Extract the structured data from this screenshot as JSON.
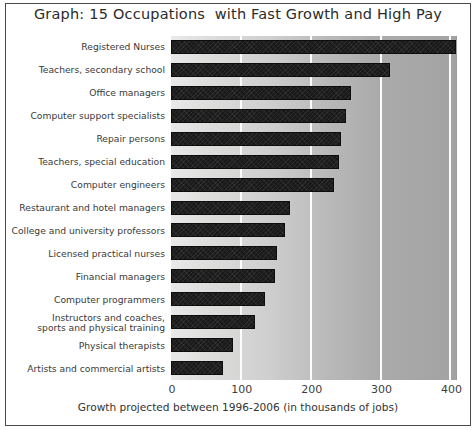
{
  "chart_data": {
    "type": "bar",
    "orientation": "horizontal",
    "title": "Graph: 15 Occupations  with Fast Growth and High Pay",
    "xlabel": "Growth projected between 1996-2006 (in thousands of jobs)",
    "ylabel": "",
    "xlim": [
      0,
      408
    ],
    "xticks": [
      0,
      100,
      200,
      300,
      400
    ],
    "xtick_labels": [
      "0",
      "100",
      "200",
      "300",
      "400"
    ],
    "grid": "vertical-white-gridlines",
    "legend": "none",
    "bar_color": "#191919",
    "plot_background": "gray-gradient-left-light-to-right-dark",
    "categories": [
      "Registered Nurses",
      "Teachers, secondary school",
      "Office managers",
      "Computer support specialists",
      "Repair persons",
      "Teachers, special education",
      "Computer engineers",
      "Restaurant and hotel managers",
      "College and university professors",
      "Licensed practical nurses",
      "Financial managers",
      "Computer programmers",
      "Instructors and coaches, sports and physical training",
      "Physical therapists",
      "Artists and commercial artists"
    ],
    "category_lines": [
      [
        "Registered Nurses"
      ],
      [
        "Teachers, secondary school"
      ],
      [
        "Office managers"
      ],
      [
        "Computer support specialists"
      ],
      [
        "Repair persons"
      ],
      [
        "Teachers, special education"
      ],
      [
        "Computer engineers"
      ],
      [
        "Restaurant and hotel managers"
      ],
      [
        "College and university professors"
      ],
      [
        "Licensed practical nurses"
      ],
      [
        "Financial managers"
      ],
      [
        "Computer programmers"
      ],
      [
        "Instructors and coaches,",
        "sports and physical training"
      ],
      [
        "Physical therapists"
      ],
      [
        "Artists and commercial artists"
      ]
    ],
    "values": [
      408,
      314,
      258,
      251,
      243,
      240,
      234,
      171,
      163,
      152,
      149,
      134,
      120,
      89,
      74
    ]
  }
}
